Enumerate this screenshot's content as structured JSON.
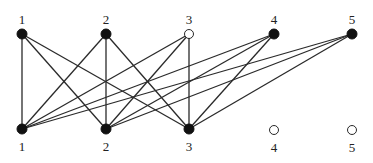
{
  "diagram": {
    "type": "bipartite-graph",
    "colors": {
      "line": "#2a2a2a",
      "filled": "#111111",
      "open_fill": "#ffffff",
      "text": "#222222"
    },
    "top_nodes": [
      {
        "id": "T1",
        "label": "1",
        "x": 22,
        "y": 34,
        "filled": true
      },
      {
        "id": "T2",
        "label": "2",
        "x": 106,
        "y": 34,
        "filled": true
      },
      {
        "id": "T3",
        "label": "3",
        "x": 189,
        "y": 34,
        "filled": false
      },
      {
        "id": "T4",
        "label": "4",
        "x": 274,
        "y": 34,
        "filled": true
      },
      {
        "id": "T5",
        "label": "5",
        "x": 352,
        "y": 34,
        "filled": true
      }
    ],
    "bottom_nodes": [
      {
        "id": "B1",
        "label": "1",
        "x": 22,
        "y": 129,
        "filled": true
      },
      {
        "id": "B2",
        "label": "2",
        "x": 106,
        "y": 129,
        "filled": true
      },
      {
        "id": "B3",
        "label": "3",
        "x": 189,
        "y": 129,
        "filled": true
      },
      {
        "id": "B4",
        "label": "4",
        "x": 274,
        "y": 130,
        "filled": false
      },
      {
        "id": "B5",
        "label": "5",
        "x": 352,
        "y": 130,
        "filled": false
      }
    ],
    "edges": [
      [
        "T1",
        "B1"
      ],
      [
        "T1",
        "B2"
      ],
      [
        "T1",
        "B3"
      ],
      [
        "T2",
        "B1"
      ],
      [
        "T2",
        "B2"
      ],
      [
        "T2",
        "B3"
      ],
      [
        "T3",
        "B1"
      ],
      [
        "T3",
        "B2"
      ],
      [
        "T3",
        "B3"
      ],
      [
        "T4",
        "B1"
      ],
      [
        "T4",
        "B2"
      ],
      [
        "T4",
        "B3"
      ],
      [
        "T5",
        "B1"
      ],
      [
        "T5",
        "B2"
      ],
      [
        "T5",
        "B3"
      ]
    ]
  }
}
